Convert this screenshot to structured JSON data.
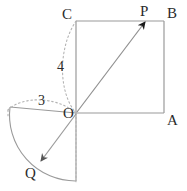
{
  "figure": {
    "colors": {
      "stroke_solid": "#9a9a9a",
      "stroke_dotted": "#b4b4b4",
      "arrow_fill": "#1a1a1a",
      "label_text": "#2b2b2b",
      "background": "#ffffff"
    },
    "points": {
      "O": {
        "label": "O",
        "x": 76,
        "y": 113
      },
      "A": {
        "label": "A",
        "x": 164,
        "y": 113
      },
      "B": {
        "label": "B",
        "x": 164,
        "y": 21
      },
      "C": {
        "label": "C",
        "x": 76,
        "y": 21
      },
      "P": {
        "label": "P",
        "x": 145,
        "y": 21
      },
      "Q": {
        "label": "Q",
        "x": 40,
        "y": 162
      }
    },
    "measures": {
      "radius_3": "3",
      "radius_4": "4"
    },
    "labels": [
      {
        "name": "point-label-C",
        "text": "C",
        "x": 62,
        "y": 7
      },
      {
        "name": "point-label-P",
        "text": "P",
        "x": 140,
        "y": 4
      },
      {
        "name": "point-label-B",
        "text": "B",
        "x": 167,
        "y": 6
      },
      {
        "name": "point-label-A",
        "text": "A",
        "x": 167,
        "y": 113
      },
      {
        "name": "point-label-O",
        "text": "O",
        "x": 63,
        "y": 109
      },
      {
        "name": "point-label-Q",
        "text": "Q",
        "x": 25,
        "y": 168
      },
      {
        "name": "measure-label-4",
        "text": "4",
        "x": 57,
        "y": 60
      },
      {
        "name": "measure-label-3",
        "text": "3",
        "x": 38,
        "y": 94
      }
    ]
  }
}
